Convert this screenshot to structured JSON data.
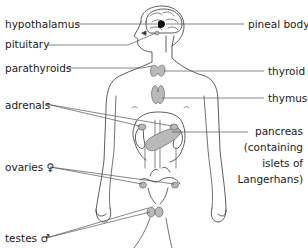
{
  "diagram": {
    "labels_left": [
      {
        "id": "hypothalamus",
        "text": "hypothalamus"
      },
      {
        "id": "pituitary",
        "text": "pituitary"
      },
      {
        "id": "parathyroids",
        "text": "parathyroids"
      },
      {
        "id": "adrenals",
        "text": "adrenals"
      },
      {
        "id": "ovaries",
        "text": "ovaries ♀"
      },
      {
        "id": "testes",
        "text": "testes ♂"
      }
    ],
    "labels_right": [
      {
        "id": "pineal",
        "text": "pineal body"
      },
      {
        "id": "thyroid",
        "text": "thyroid"
      },
      {
        "id": "thymus",
        "text": "thymus"
      },
      {
        "id": "pancreas",
        "lines": [
          "pancreas",
          "(containing",
          "islets of",
          "Langerhans)"
        ]
      }
    ],
    "colors": {
      "outline": "#333333",
      "gland_fill": "#b9b9b9",
      "leader_line": "#555555",
      "pineal_fill": "#111111"
    }
  }
}
